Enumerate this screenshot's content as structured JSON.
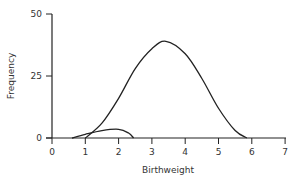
{
  "chart_data": {
    "type": "line",
    "title": "",
    "xlabel": "Birthweight",
    "ylabel": "Frequency",
    "xlim": [
      0,
      7
    ],
    "ylim": [
      0,
      50
    ],
    "x_ticks": [
      "0",
      "1",
      "2",
      "3",
      "4",
      "5",
      "6",
      "7"
    ],
    "y_ticks": [
      "0",
      "25",
      "50"
    ],
    "grid": false,
    "legend": null,
    "series": [
      {
        "name": "main distribution",
        "x": [
          1.0,
          1.5,
          2.0,
          2.5,
          3.0,
          3.42,
          4.0,
          4.5,
          5.0,
          5.5,
          5.85
        ],
        "values": [
          0,
          6,
          16,
          28,
          36,
          39,
          34,
          24,
          12,
          3,
          0
        ]
      },
      {
        "name": "low birthweight distribution",
        "x": [
          0.6,
          1.0,
          1.5,
          2.0,
          2.3,
          2.45
        ],
        "values": [
          0,
          1.5,
          3,
          3.5,
          2,
          0
        ]
      }
    ]
  }
}
